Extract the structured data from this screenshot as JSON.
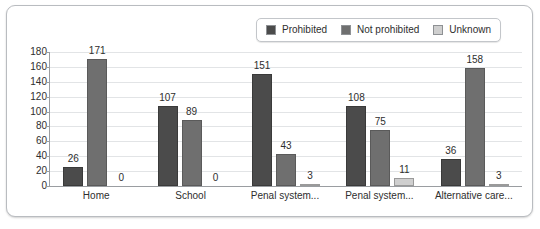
{
  "chart_data": {
    "type": "bar",
    "title": "",
    "subtitle": "",
    "xlabel": "",
    "ylabel": "",
    "ylim": [
      0,
      180
    ],
    "yticks": [
      0,
      20,
      40,
      60,
      80,
      100,
      120,
      140,
      160,
      180
    ],
    "grid": true,
    "legend_position": "top-right",
    "categories": [
      "Home",
      "School",
      "Penal system...",
      "Penal system...",
      "Alternative care..."
    ],
    "series": [
      {
        "name": "Prohibited",
        "color": "#4b4b4b",
        "values": [
          26,
          107,
          151,
          108,
          36
        ]
      },
      {
        "name": "Not prohibited",
        "color": "#6f6f6f",
        "values": [
          171,
          89,
          43,
          75,
          158
        ]
      },
      {
        "name": "Unknown",
        "color": "#cfcfcf",
        "values": [
          0,
          0,
          3,
          11,
          3
        ]
      }
    ],
    "data_labels": [
      [
        "26",
        "171",
        "0"
      ],
      [
        "107",
        "89",
        "0"
      ],
      [
        "151",
        "43",
        "3"
      ],
      [
        "108",
        "75",
        "11"
      ],
      [
        "36",
        "158",
        "3"
      ]
    ]
  },
  "legend": {
    "items": [
      {
        "label": "Prohibited",
        "color": "#4b4b4b"
      },
      {
        "label": "Not prohibited",
        "color": "#6f6f6f"
      },
      {
        "label": "Unknown",
        "color": "#cfcfcf"
      }
    ]
  },
  "colors": {
    "frame_border": "#b9bcc0",
    "axis": "#9a9da1",
    "gridline": "#e2e4e6",
    "text": "#2e2e2e",
    "background": "#ffffff"
  }
}
